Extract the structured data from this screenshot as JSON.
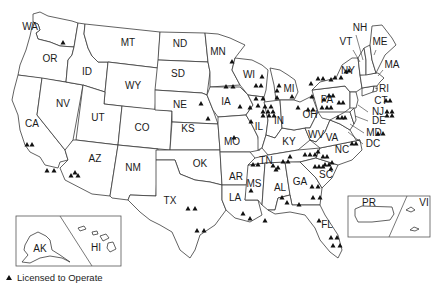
{
  "map": {
    "title": "Licensed to Operate locations by state",
    "marker_color": "#111111",
    "outline_color": "#3a3a3a",
    "states": [
      {
        "code": "WA",
        "x": 30,
        "y": 30
      },
      {
        "code": "OR",
        "x": 50,
        "y": 62
      },
      {
        "code": "CA",
        "x": 32,
        "y": 127
      },
      {
        "code": "NV",
        "x": 63,
        "y": 107
      },
      {
        "code": "ID",
        "x": 87,
        "y": 75
      },
      {
        "code": "MT",
        "x": 128,
        "y": 46
      },
      {
        "code": "WY",
        "x": 133,
        "y": 89
      },
      {
        "code": "UT",
        "x": 98,
        "y": 121
      },
      {
        "code": "CO",
        "x": 142,
        "y": 131
      },
      {
        "code": "AZ",
        "x": 95,
        "y": 162
      },
      {
        "code": "NM",
        "x": 133,
        "y": 171
      },
      {
        "code": "ND",
        "x": 180,
        "y": 47
      },
      {
        "code": "SD",
        "x": 178,
        "y": 77
      },
      {
        "code": "NE",
        "x": 180,
        "y": 108
      },
      {
        "code": "KS",
        "x": 188,
        "y": 132
      },
      {
        "code": "OK",
        "x": 200,
        "y": 167
      },
      {
        "code": "TX",
        "x": 170,
        "y": 204
      },
      {
        "code": "MN",
        "x": 218,
        "y": 55
      },
      {
        "code": "IA",
        "x": 226,
        "y": 105
      },
      {
        "code": "MO",
        "x": 232,
        "y": 145
      },
      {
        "code": "AR",
        "x": 236,
        "y": 180
      },
      {
        "code": "LA",
        "x": 235,
        "y": 201
      },
      {
        "code": "WI",
        "x": 249,
        "y": 78
      },
      {
        "code": "IL",
        "x": 259,
        "y": 130
      },
      {
        "code": "MS",
        "x": 254,
        "y": 187
      },
      {
        "code": "MI",
        "x": 289,
        "y": 92
      },
      {
        "code": "IN",
        "x": 279,
        "y": 124
      },
      {
        "code": "KY",
        "x": 289,
        "y": 145
      },
      {
        "code": "TN",
        "x": 266,
        "y": 164
      },
      {
        "code": "AL",
        "x": 280,
        "y": 191
      },
      {
        "code": "OH",
        "x": 310,
        "y": 118
      },
      {
        "code": "WV",
        "x": 316,
        "y": 138
      },
      {
        "code": "VA",
        "x": 332,
        "y": 141
      },
      {
        "code": "NC",
        "x": 342,
        "y": 153
      },
      {
        "code": "SC",
        "x": 326,
        "y": 178
      },
      {
        "code": "GA",
        "x": 300,
        "y": 185
      },
      {
        "code": "FL",
        "x": 327,
        "y": 228
      },
      {
        "code": "PA",
        "x": 327,
        "y": 103
      },
      {
        "code": "NY",
        "x": 348,
        "y": 74
      },
      {
        "code": "VT",
        "x": 346,
        "y": 45
      },
      {
        "code": "NH",
        "x": 360,
        "y": 31
      },
      {
        "code": "ME",
        "x": 380,
        "y": 45
      },
      {
        "code": "MA",
        "x": 392,
        "y": 68
      },
      {
        "code": "RI",
        "x": 384,
        "y": 92
      },
      {
        "code": "CT",
        "x": 381,
        "y": 104
      },
      {
        "code": "NJ",
        "x": 378,
        "y": 115
      },
      {
        "code": "DE",
        "x": 379,
        "y": 124
      },
      {
        "code": "MD",
        "x": 374,
        "y": 136
      },
      {
        "code": "DC",
        "x": 373,
        "y": 147
      }
    ],
    "markers": [
      [
        63,
        43
      ],
      [
        27,
        145
      ],
      [
        32,
        145
      ],
      [
        47,
        171
      ],
      [
        54,
        171
      ],
      [
        75,
        173
      ],
      [
        71,
        176
      ],
      [
        78,
        176
      ],
      [
        201,
        104
      ],
      [
        208,
        119
      ],
      [
        232,
        62
      ],
      [
        226,
        87
      ],
      [
        233,
        87
      ],
      [
        262,
        77
      ],
      [
        256,
        86
      ],
      [
        261,
        86
      ],
      [
        240,
        107
      ],
      [
        250,
        108
      ],
      [
        256,
        99
      ],
      [
        263,
        99
      ],
      [
        258,
        106
      ],
      [
        265,
        107
      ],
      [
        271,
        107
      ],
      [
        263,
        112
      ],
      [
        268,
        112
      ],
      [
        273,
        112
      ],
      [
        263,
        116
      ],
      [
        269,
        116
      ],
      [
        274,
        116
      ],
      [
        251,
        122
      ],
      [
        234,
        138
      ],
      [
        279,
        86
      ],
      [
        277,
        91
      ],
      [
        277,
        98
      ],
      [
        292,
        97
      ],
      [
        298,
        108
      ],
      [
        312,
        97
      ],
      [
        311,
        84
      ],
      [
        318,
        79
      ],
      [
        323,
        79
      ],
      [
        331,
        80
      ],
      [
        335,
        78
      ],
      [
        341,
        78
      ],
      [
        346,
        72
      ],
      [
        349,
        71
      ],
      [
        324,
        100
      ],
      [
        329,
        96
      ],
      [
        333,
        96
      ],
      [
        322,
        108
      ],
      [
        327,
        108
      ],
      [
        331,
        108
      ],
      [
        308,
        110
      ],
      [
        313,
        110
      ],
      [
        339,
        103
      ],
      [
        343,
        103
      ],
      [
        338,
        118
      ],
      [
        342,
        118
      ],
      [
        345,
        118
      ],
      [
        352,
        144
      ],
      [
        356,
        144
      ],
      [
        386,
        101
      ],
      [
        390,
        101
      ],
      [
        387,
        112
      ],
      [
        392,
        112
      ],
      [
        387,
        116
      ],
      [
        392,
        116
      ],
      [
        378,
        134
      ],
      [
        383,
        134
      ],
      [
        305,
        155
      ],
      [
        310,
        155
      ],
      [
        315,
        155
      ],
      [
        318,
        152
      ],
      [
        323,
        157
      ],
      [
        327,
        157
      ],
      [
        325,
        165
      ],
      [
        329,
        165
      ],
      [
        332,
        163
      ],
      [
        315,
        167
      ],
      [
        319,
        167
      ],
      [
        323,
        167
      ],
      [
        331,
        169
      ],
      [
        283,
        162
      ],
      [
        288,
        162
      ],
      [
        290,
        157
      ],
      [
        273,
        166
      ],
      [
        276,
        170
      ],
      [
        278,
        168
      ],
      [
        282,
        198
      ],
      [
        287,
        203
      ],
      [
        312,
        187
      ],
      [
        318,
        187
      ],
      [
        313,
        198
      ],
      [
        320,
        198
      ],
      [
        253,
        165
      ],
      [
        258,
        165
      ],
      [
        251,
        191
      ],
      [
        243,
        214
      ],
      [
        250,
        219
      ],
      [
        265,
        221
      ],
      [
        299,
        205
      ],
      [
        188,
        209
      ],
      [
        195,
        209
      ],
      [
        197,
        231
      ],
      [
        204,
        231
      ],
      [
        319,
        221
      ],
      [
        331,
        238
      ],
      [
        337,
        238
      ],
      [
        333,
        246
      ],
      [
        340,
        246
      ]
    ],
    "insets": {
      "alaska_hawaii": {
        "labels": [
          "AK",
          "HI"
        ]
      },
      "puerto_rico_vi": {
        "labels": [
          "PR",
          "VI"
        ]
      }
    }
  },
  "legend": {
    "symbol": "triangle",
    "label": "Licensed to Operate"
  }
}
